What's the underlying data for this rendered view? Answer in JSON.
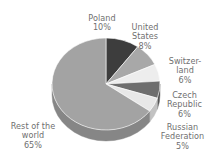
{
  "chart_data": {
    "type": "pie",
    "title": "",
    "subtitle": "",
    "xlabel": "",
    "ylabel": "",
    "legend_position": "none",
    "grid": false,
    "style": "3d-pie-grayscale",
    "units": "percent",
    "start_angle_deg": 0,
    "direction": "clockwise",
    "categories": [
      "Poland",
      "United States",
      "Switzerland",
      "Czech Republic",
      "Russian Federation",
      "Rest of the world"
    ],
    "values": [
      10,
      8,
      6,
      6,
      5,
      65
    ],
    "value_labels": [
      "10%",
      "8%",
      "6%",
      "6%",
      "5%",
      "65%"
    ],
    "colors": [
      "#3d3d3d",
      "#a8a8a8",
      "#ededed",
      "#6e6e6e",
      "#e8e8e8",
      "#a3a3a3"
    ],
    "slices": [
      {
        "name": "Poland",
        "value": 10,
        "value_label": "10%",
        "color": "#3d3d3d",
        "side_color": "#2b2b2b"
      },
      {
        "name": "United States",
        "value": 8,
        "value_label": "8%",
        "color": "#a8a8a8",
        "side_color": "#8a8a8a"
      },
      {
        "name": "Switzerland",
        "value": 6,
        "value_label": "6%",
        "color": "#ededed",
        "side_color": "#c6c6c6"
      },
      {
        "name": "Czech Republic",
        "value": 6,
        "value_label": "6%",
        "color": "#6e6e6e",
        "side_color": "#565656"
      },
      {
        "name": "Russian Federation",
        "value": 5,
        "value_label": "5%",
        "color": "#e8e8e8",
        "side_color": "#c2c2c2"
      },
      {
        "name": "Rest of the world",
        "value": 65,
        "value_label": "65%",
        "color": "#a3a3a3",
        "side_color": "#868686"
      }
    ]
  },
  "labels": {
    "poland": {
      "name": "Poland",
      "percent": "10%"
    },
    "us": {
      "name": "United\nStates",
      "percent": "8%"
    },
    "switzerland": {
      "name": "Switzer-\nland",
      "percent": "6%"
    },
    "czech": {
      "name": "Czech\nRepublic",
      "percent": "6%"
    },
    "russia": {
      "name": "Russian\nFederation",
      "percent": "5%"
    },
    "rest": {
      "name": "Rest of the\nworld",
      "percent": "65%"
    }
  },
  "background_color": "#ffffff",
  "label_color": "#6f6f6f"
}
